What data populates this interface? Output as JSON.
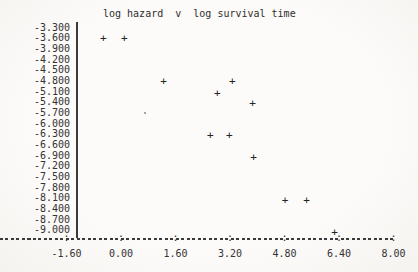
{
  "page": {
    "background": "#fbfaf7",
    "ink_color": "#2e2e2e"
  },
  "chart_data": {
    "type": "scatter",
    "title": "log hazard  v  log survival time",
    "xlabel": "",
    "ylabel": "",
    "marker": "+",
    "grid": false,
    "legend": null,
    "xlim": [
      -1.6,
      8.0
    ],
    "ylim": [
      -9.0,
      -3.3
    ],
    "x_tick_labels": [
      "-1.60",
      "0.00",
      "1.60",
      "3.20",
      "4.80",
      "6.40",
      "8.00"
    ],
    "y_tick_labels": [
      "-3.300",
      "-3.600",
      "-3.900",
      "-4.200",
      "-4.500",
      "-4.800",
      "-5.100",
      "-5.400",
      "-5.700",
      "-6.000",
      "-6.300",
      "-6.600",
      "-6.900",
      "-7.200",
      "-7.500",
      "-7.800",
      "-8.100",
      "-8.400",
      "-8.700",
      "-9.000"
    ],
    "points": [
      {
        "x": -0.52,
        "y": -3.6,
        "marker": "+"
      },
      {
        "x": 0.1,
        "y": -3.6,
        "marker": "+"
      },
      {
        "x": 1.25,
        "y": -4.8,
        "marker": "+"
      },
      {
        "x": 3.27,
        "y": -4.8,
        "marker": "+"
      },
      {
        "x": 2.83,
        "y": -5.15,
        "marker": "+"
      },
      {
        "x": 3.86,
        "y": -5.42,
        "marker": "+"
      },
      {
        "x": 0.7,
        "y": -5.7,
        "marker": "."
      },
      {
        "x": 2.62,
        "y": -6.32,
        "marker": "+"
      },
      {
        "x": 3.18,
        "y": -6.32,
        "marker": "+"
      },
      {
        "x": 3.89,
        "y": -6.95,
        "marker": "+"
      },
      {
        "x": 4.82,
        "y": -8.15,
        "marker": "+"
      },
      {
        "x": 5.45,
        "y": -8.15,
        "marker": "+"
      },
      {
        "x": 6.27,
        "y": -9.03,
        "marker": "+"
      }
    ]
  }
}
